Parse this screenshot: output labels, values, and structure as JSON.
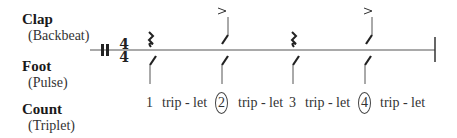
{
  "rows": {
    "clap": {
      "label": "Clap",
      "sublabel": "(Backbeat)"
    },
    "foot": {
      "label": "Foot",
      "sublabel": "(Pulse)"
    },
    "count": {
      "label": "Count",
      "sublabel": "(Triplet)"
    }
  },
  "time_signature": {
    "top": "4",
    "bottom": "4"
  },
  "count_text": [
    {
      "num": "1",
      "circled": false,
      "triplet": "trip - let"
    },
    {
      "num": "2",
      "circled": true,
      "triplet": "trip - let"
    },
    {
      "num": "3",
      "circled": false,
      "triplet": "trip - let"
    },
    {
      "num": "4",
      "circled": true,
      "triplet": "trip - let"
    }
  ],
  "clap_pattern": [
    "rest",
    "accented-hit",
    "rest",
    "accented-hit"
  ],
  "foot_pattern": [
    "hit",
    "hit",
    "hit",
    "hit"
  ],
  "accent_symbol": ">"
}
